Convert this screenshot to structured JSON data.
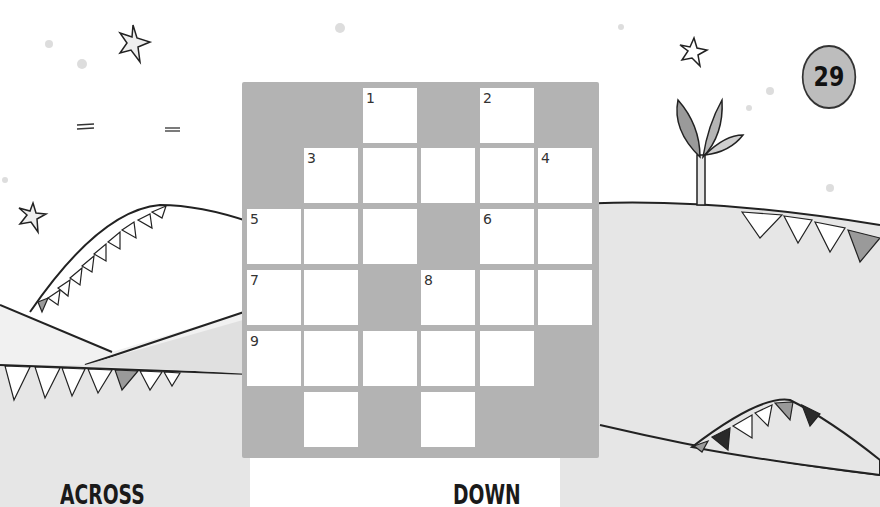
{
  "page": {
    "page_number": "29"
  },
  "crossword": {
    "rows": 6,
    "cols": 6,
    "layout": [
      [
        0,
        0,
        1,
        0,
        1,
        0
      ],
      [
        0,
        1,
        1,
        1,
        1,
        1
      ],
      [
        1,
        1,
        1,
        0,
        1,
        1
      ],
      [
        1,
        1,
        0,
        1,
        1,
        1
      ],
      [
        1,
        1,
        1,
        1,
        1,
        0
      ],
      [
        0,
        1,
        0,
        1,
        0,
        0
      ]
    ],
    "numbers": [
      {
        "n": "1",
        "row": 0,
        "col": 2
      },
      {
        "n": "2",
        "row": 0,
        "col": 4
      },
      {
        "n": "3",
        "row": 1,
        "col": 1
      },
      {
        "n": "4",
        "row": 1,
        "col": 5
      },
      {
        "n": "5",
        "row": 2,
        "col": 0
      },
      {
        "n": "6",
        "row": 2,
        "col": 4
      },
      {
        "n": "7",
        "row": 3,
        "col": 0
      },
      {
        "n": "8",
        "row": 3,
        "col": 3
      },
      {
        "n": "9",
        "row": 4,
        "col": 0
      }
    ],
    "colors": {
      "block": "#b3b3b3",
      "open": "#ffffff"
    }
  },
  "clues": {
    "across_heading": "ACROSS",
    "down_heading": "DOWN"
  },
  "decorations": {
    "icons": [
      "star-icon",
      "star-icon",
      "star-icon",
      "star-icon",
      "plant-icon",
      "bunting-icon",
      "hill-icon"
    ],
    "colors": {
      "sky": "#ffffff",
      "hill": "#e4e4e4",
      "hill_light": "#f1f1f1",
      "ink": "#222222",
      "flag_mid": "#9a9a9a",
      "flag_dark": "#2a2a2a"
    }
  }
}
